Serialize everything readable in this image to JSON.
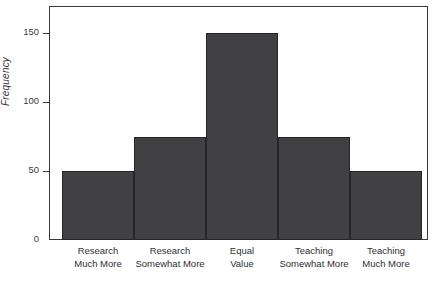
{
  "chart_data": {
    "type": "bar",
    "title": "",
    "xlabel": "",
    "ylabel": "Frequency",
    "categories": [
      "Research Much More",
      "Research Somewhat More",
      "Equal Value",
      "Teaching Somewhat More",
      "Teaching Much More"
    ],
    "category_lines": [
      [
        "Research",
        "Much More"
      ],
      [
        "Research",
        "Somewhat More"
      ],
      [
        "Equal",
        "Value"
      ],
      [
        "Teaching",
        "Somewhat More"
      ],
      [
        "Teaching",
        "Much More"
      ]
    ],
    "values": [
      50,
      75,
      150,
      75,
      50
    ],
    "ylim": [
      0,
      170
    ],
    "yticks": [
      0,
      50,
      100,
      150
    ],
    "ytick_labels": [
      "0",
      "50",
      "100",
      "150"
    ],
    "grid": false,
    "legend": null,
    "bar_color": "#414143",
    "bar_edge_color": "#26262a",
    "axis_color": "#3a3a3c",
    "background": "#ffffff"
  }
}
